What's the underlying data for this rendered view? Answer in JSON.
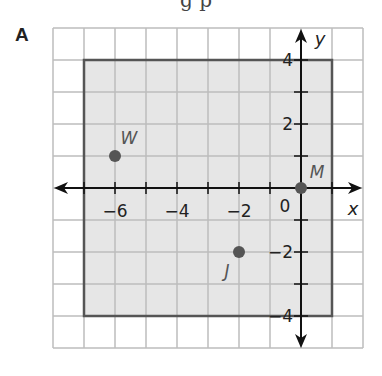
{
  "top_text_fragment": "g p",
  "panel": {
    "label": "A"
  },
  "chart_data": {
    "type": "scatter",
    "title": "",
    "xlabel": "x",
    "ylabel": "y",
    "xlim": [
      -8,
      2
    ],
    "ylim": [
      -5,
      5
    ],
    "grid": true,
    "x_tick_labels": [
      "−6",
      "−4",
      "−2"
    ],
    "x_tick_values": [
      -6,
      -4,
      -2
    ],
    "y_tick_labels": [
      "4",
      "2",
      "−2",
      "−4"
    ],
    "y_tick_values": [
      4,
      2,
      -2,
      -4
    ],
    "origin_label": "0",
    "points": [
      {
        "label": "W",
        "x": -6,
        "y": 1
      },
      {
        "label": "M",
        "x": 0,
        "y": 0
      },
      {
        "label": "J",
        "x": -2,
        "y": -2
      }
    ],
    "shaded_rectangle": {
      "x_min": -7,
      "x_max": 1,
      "y_min": -4,
      "y_max": 4
    },
    "colors": {
      "grid": "#bdbdbd",
      "shade": "#e6e6e6",
      "rectangle_border": "#555555",
      "point": "#555555",
      "axis": "#111111"
    }
  }
}
